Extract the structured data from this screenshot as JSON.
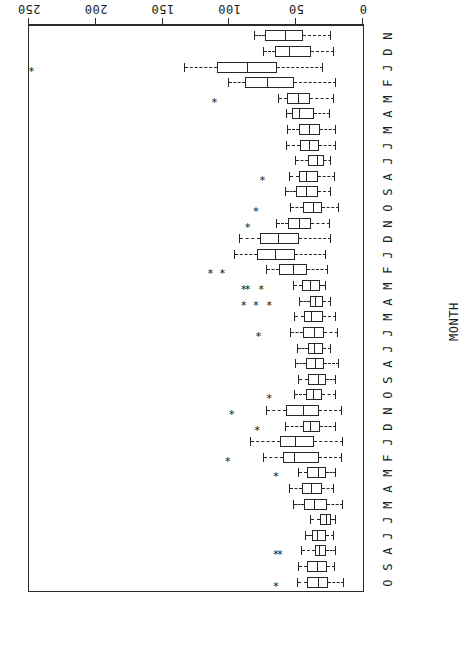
{
  "chart_data": {
    "type": "boxplot",
    "title": "",
    "orientation": "horizontal-rotated-180",
    "xlabel": "SO2 CONCENTRATION, ppb",
    "ylabel": "MONTH",
    "xlim": [
      0,
      250
    ],
    "xticks": [
      0,
      50,
      100,
      150,
      200,
      250
    ],
    "xticklabels": [
      "0",
      "50",
      "100",
      "150",
      "200",
      "250"
    ],
    "grid": false,
    "legend": null,
    "categories": [
      "O",
      "S",
      "A",
      "J",
      "J",
      "M",
      "A",
      "M",
      "F",
      "J",
      "D",
      "N",
      "O",
      "S",
      "A",
      "J",
      "J",
      "M",
      "A",
      "M",
      "F",
      "J",
      "D",
      "N",
      "O",
      "S",
      "A",
      "J",
      "J",
      "M",
      "A",
      "M",
      "F",
      "J",
      "D",
      "N"
    ],
    "boxes": [
      {
        "month": "O",
        "whisker_low": 14,
        "q1": 26,
        "median": 33,
        "q3": 42,
        "whisker_high": 49,
        "outliers": [
          65
        ]
      },
      {
        "month": "S",
        "whisker_low": 21,
        "q1": 27,
        "median": 34,
        "q3": 42,
        "whisker_high": 48,
        "outliers": []
      },
      {
        "month": "A",
        "whisker_low": 20,
        "q1": 28,
        "median": 32,
        "q3": 36,
        "whisker_high": 46,
        "outliers": [
          62,
          65
        ]
      },
      {
        "month": "J",
        "whisker_low": 22,
        "q1": 28,
        "median": 34,
        "q3": 38,
        "whisker_high": 43,
        "outliers": []
      },
      {
        "month": "J",
        "whisker_low": 20,
        "q1": 24,
        "median": 27,
        "q3": 32,
        "whisker_high": 39,
        "outliers": []
      },
      {
        "month": "M",
        "whisker_low": 15,
        "q1": 27,
        "median": 36,
        "q3": 44,
        "whisker_high": 52,
        "outliers": []
      },
      {
        "month": "A",
        "whisker_low": 22,
        "q1": 31,
        "median": 38,
        "q3": 46,
        "whisker_high": 55,
        "outliers": []
      },
      {
        "month": "M",
        "whisker_low": 20,
        "q1": 28,
        "median": 33,
        "q3": 42,
        "whisker_high": 48,
        "outliers": [
          65
        ]
      },
      {
        "month": "F",
        "whisker_low": 16,
        "q1": 33,
        "median": 51,
        "q3": 60,
        "whisker_high": 74,
        "outliers": [
          101
        ]
      },
      {
        "month": "J",
        "whisker_low": 15,
        "q1": 37,
        "median": 50,
        "q3": 62,
        "whisker_high": 84,
        "outliers": []
      },
      {
        "month": "D",
        "whisker_low": 20,
        "q1": 32,
        "median": 39,
        "q3": 45,
        "whisker_high": 58,
        "outliers": [
          79
        ]
      },
      {
        "month": "N",
        "whisker_low": 16,
        "q1": 33,
        "median": 44,
        "q3": 58,
        "whisker_high": 72,
        "outliers": [
          98
        ]
      },
      {
        "month": "O",
        "whisker_low": 20,
        "q1": 31,
        "median": 37,
        "q3": 43,
        "whisker_high": 51,
        "outliers": [
          70
        ]
      },
      {
        "month": "S",
        "whisker_low": 20,
        "q1": 28,
        "median": 33,
        "q3": 41,
        "whisker_high": 48,
        "outliers": []
      },
      {
        "month": "A",
        "whisker_low": 18,
        "q1": 29,
        "median": 35,
        "q3": 43,
        "whisker_high": 50,
        "outliers": []
      },
      {
        "month": "J",
        "whisker_low": 24,
        "q1": 30,
        "median": 36,
        "q3": 41,
        "whisker_high": 49,
        "outliers": []
      },
      {
        "month": "J",
        "whisker_low": 19,
        "q1": 29,
        "median": 36,
        "q3": 45,
        "whisker_high": 54,
        "outliers": [
          78
        ]
      },
      {
        "month": "M",
        "whisker_low": 20,
        "q1": 30,
        "median": 38,
        "q3": 44,
        "whisker_high": 51,
        "outliers": []
      },
      {
        "month": "A",
        "whisker_low": 24,
        "q1": 30,
        "median": 35,
        "q3": 40,
        "whisker_high": 47,
        "outliers": [
          70,
          80,
          89
        ]
      },
      {
        "month": "M",
        "whisker_low": 28,
        "q1": 32,
        "median": 39,
        "q3": 46,
        "whisker_high": 52,
        "outliers": [
          76,
          86,
          89
        ]
      },
      {
        "month": "F",
        "whisker_low": 26,
        "q1": 42,
        "median": 52,
        "q3": 63,
        "whisker_high": 72,
        "outliers": [
          105,
          114
        ]
      },
      {
        "month": "J",
        "whisker_low": 28,
        "q1": 51,
        "median": 65,
        "q3": 79,
        "whisker_high": 96,
        "outliers": []
      },
      {
        "month": "D",
        "whisker_low": 24,
        "q1": 48,
        "median": 63,
        "q3": 77,
        "whisker_high": 92,
        "outliers": []
      },
      {
        "month": "N",
        "whisker_low": 25,
        "q1": 39,
        "median": 47,
        "q3": 56,
        "whisker_high": 64,
        "outliers": [
          86
        ]
      },
      {
        "month": "O",
        "whisker_low": 18,
        "q1": 31,
        "median": 37,
        "q3": 45,
        "whisker_high": 54,
        "outliers": [
          80
        ]
      },
      {
        "month": "S",
        "whisker_low": 24,
        "q1": 34,
        "median": 42,
        "q3": 50,
        "whisker_high": 58,
        "outliers": []
      },
      {
        "month": "A",
        "whisker_low": 21,
        "q1": 34,
        "median": 42,
        "q3": 48,
        "whisker_high": 55,
        "outliers": [
          75
        ]
      },
      {
        "month": "J",
        "whisker_low": 24,
        "q1": 29,
        "median": 34,
        "q3": 41,
        "whisker_high": 50,
        "outliers": []
      },
      {
        "month": "J",
        "whisker_low": 20,
        "q1": 33,
        "median": 40,
        "q3": 47,
        "whisker_high": 57,
        "outliers": []
      },
      {
        "month": "M",
        "whisker_low": 20,
        "q1": 32,
        "median": 40,
        "q3": 48,
        "whisker_high": 56,
        "outliers": []
      },
      {
        "month": "A",
        "whisker_low": 25,
        "q1": 37,
        "median": 47,
        "q3": 53,
        "whisker_high": 57,
        "outliers": []
      },
      {
        "month": "M",
        "whisker_low": 22,
        "q1": 40,
        "median": 48,
        "q3": 57,
        "whisker_high": 63,
        "outliers": [
          111
        ]
      },
      {
        "month": "F",
        "whisker_low": 20,
        "q1": 52,
        "median": 71,
        "q3": 88,
        "whisker_high": 100,
        "outliers": []
      },
      {
        "month": "J",
        "whisker_low": 30,
        "q1": 64,
        "median": 86,
        "q3": 109,
        "whisker_high": 133,
        "outliers": [
          248
        ]
      },
      {
        "month": "D",
        "whisker_low": 22,
        "q1": 39,
        "median": 55,
        "q3": 66,
        "whisker_high": 74,
        "outliers": []
      },
      {
        "month": "N",
        "whisker_low": 24,
        "q1": 45,
        "median": 58,
        "q3": 73,
        "whisker_high": 81,
        "outliers": []
      }
    ]
  },
  "axes": {
    "x_title": "SO2 CONCENTRATION, ppb",
    "y_title": "MONTH",
    "x_tick_labels": [
      "250",
      "200",
      "150",
      "100",
      "50",
      "0"
    ],
    "month_labels": [
      "O",
      "S",
      "A",
      "J",
      "J",
      "M",
      "A",
      "M",
      "F",
      "J",
      "D",
      "N",
      "O",
      "S",
      "A",
      "J",
      "J",
      "M",
      "A",
      "M",
      "F",
      "J",
      "D",
      "N",
      "O",
      "S",
      "A",
      "J",
      "J",
      "M",
      "A",
      "M",
      "F",
      "J",
      "D",
      "N"
    ]
  },
  "style": {
    "line_color": "#262626",
    "box_fill": "#ffffff",
    "background": "#ffffff",
    "outlier_glyph": "*"
  }
}
